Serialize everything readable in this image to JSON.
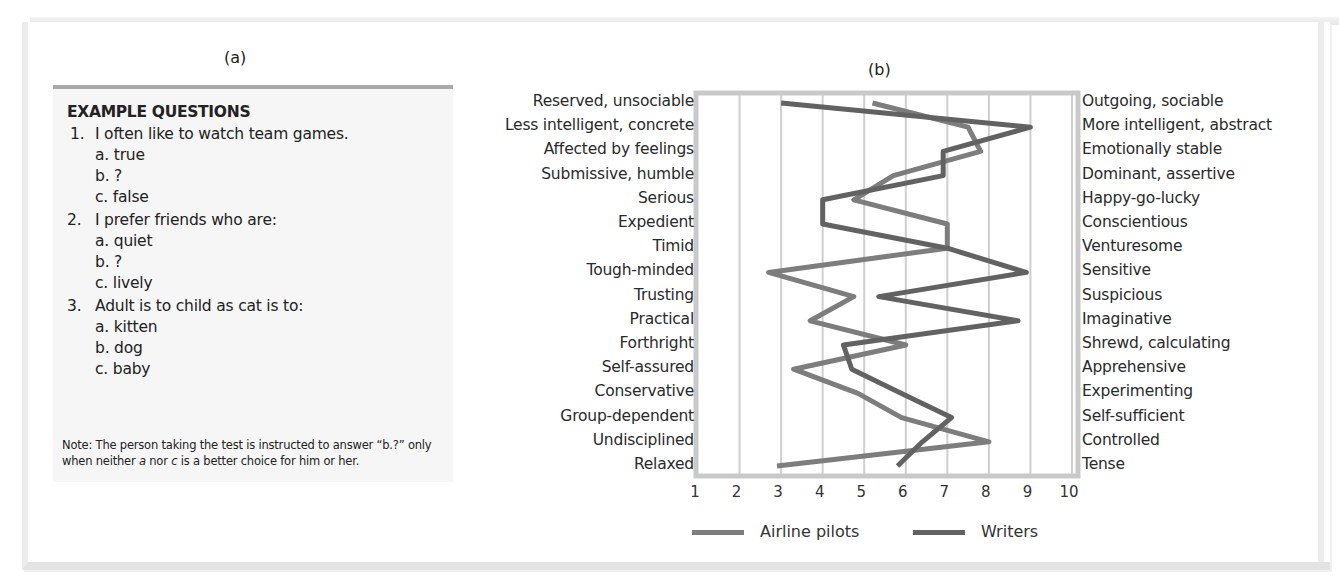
{
  "panel_a": {
    "label": "(a)",
    "title": "EXAMPLE QUESTIONS",
    "questions": [
      {
        "number": "1.",
        "text": "I often like to watch team games.",
        "options": [
          "a. true",
          "b. ?",
          "c. false"
        ]
      },
      {
        "number": "2.",
        "text": "I prefer friends who are:",
        "options": [
          "a. quiet",
          "b. ?",
          "c. lively"
        ]
      },
      {
        "number": "3.",
        "text": "Adult is to child as cat is to:",
        "options": [
          "a. kitten",
          "b. dog",
          "c. baby"
        ]
      }
    ],
    "note_prefix": "Note: The person taking the test is instructed to answer “b.?” only when neither ",
    "note_a": "a",
    "note_mid": " nor ",
    "note_c": "c",
    "note_suffix": " is a better choice for him or her."
  },
  "panel_b": {
    "label": "(b)"
  },
  "chart_data": {
    "type": "line",
    "orientation": "horizontal-profile",
    "title": "(b)",
    "xlabel": "",
    "ylabel": "",
    "xlim": [
      1,
      10
    ],
    "x_ticks": [
      "1",
      "2",
      "3",
      "4",
      "5",
      "6",
      "7",
      "8",
      "9",
      "10"
    ],
    "grid": true,
    "legend_position": "bottom",
    "left_traits": [
      "Reserved, unsociable",
      "Less intelligent, concrete",
      "Affected by feelings",
      "Submissive, humble",
      "Serious",
      "Expedient",
      "Timid",
      "Tough-minded",
      "Trusting",
      "Practical",
      "Forthright",
      "Self-assured",
      "Conservative",
      "Group-dependent",
      "Undisciplined",
      "Relaxed"
    ],
    "right_traits": [
      "Outgoing, sociable",
      "More intelligent, abstract",
      "Emotionally stable",
      "Dominant, assertive",
      "Happy-go-lucky",
      "Conscientious",
      "Venturesome",
      "Sensitive",
      "Suspicious",
      "Imaginative",
      "Shrewd, calculating",
      "Apprehensive",
      "Experimenting",
      "Self-sufficient",
      "Controlled",
      "Tense"
    ],
    "series": [
      {
        "name": "Airline pilots",
        "color": "#7d7d7d",
        "values": [
          5.2,
          7.5,
          7.8,
          5.7,
          4.75,
          7.0,
          7.0,
          2.7,
          4.75,
          3.7,
          6.0,
          3.3,
          4.85,
          5.9,
          8.0,
          2.9
        ]
      },
      {
        "name": "Writers",
        "color": "#626262",
        "values": [
          3.0,
          9.0,
          6.9,
          6.9,
          4.0,
          4.0,
          7.0,
          8.9,
          5.35,
          8.7,
          4.5,
          4.7,
          5.9,
          7.1,
          6.4,
          5.8
        ]
      }
    ]
  }
}
